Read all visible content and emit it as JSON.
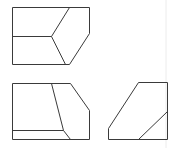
{
  "diagram": {
    "type": "orthographic-three-view-drawing",
    "colors": {
      "line": "#3a3a3a",
      "background": "#ffffff",
      "page_edge": "#ececec"
    },
    "views": [
      {
        "name": "top-view",
        "outline": [
          [
            12,
            7
          ],
          [
            89,
            7
          ],
          [
            89,
            33
          ],
          [
            69,
            64
          ],
          [
            12,
            64
          ]
        ],
        "inner_lines": [
          [
            [
              12,
              36
            ],
            [
              51,
              36
            ]
          ],
          [
            [
              51,
              36
            ],
            [
              69,
              7
            ]
          ],
          [
            [
              51,
              36
            ],
            [
              65,
              64
            ]
          ]
        ]
      },
      {
        "name": "front-view",
        "outline": [
          [
            12,
            83
          ],
          [
            70,
            83
          ],
          [
            89,
            110
          ],
          [
            89,
            139
          ],
          [
            12,
            139
          ]
        ],
        "inner_lines": [
          [
            [
              51,
              83
            ],
            [
              63,
              130
            ]
          ],
          [
            [
              12,
              130
            ],
            [
              63,
              130
            ]
          ],
          [
            [
              63,
              130
            ],
            [
              70,
              139
            ]
          ]
        ]
      },
      {
        "name": "side-view",
        "outline": [
          [
            138,
            82
          ],
          [
            167,
            82
          ],
          [
            167,
            139
          ],
          [
            108,
            139
          ],
          [
            108,
            128
          ]
        ],
        "inner_lines": [
          [
            [
              138,
              139
            ],
            [
              167,
              111
            ]
          ]
        ]
      }
    ]
  }
}
